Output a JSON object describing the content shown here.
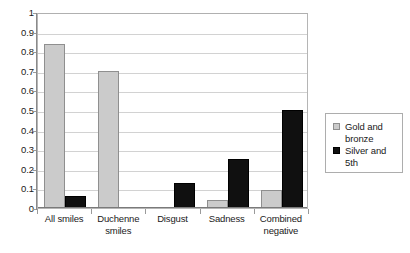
{
  "chart_data": {
    "type": "bar",
    "title": "",
    "subtitle": "",
    "xlabel": "",
    "ylabel": "",
    "ylim": [
      0,
      1
    ],
    "ytick_step": 0.1,
    "ytick_labels": [
      "1",
      "0.9",
      "0.8",
      "0.7",
      "0.6",
      "0.5",
      "0.4",
      "0.3",
      "0.2",
      "0.1",
      "0"
    ],
    "ytick_values": [
      1,
      0.9,
      0.8,
      0.7,
      0.6,
      0.5,
      0.4,
      0.3,
      0.2,
      0.1,
      0
    ],
    "grid": true,
    "grid_axis": "y",
    "legend_position": "right-outside",
    "categories": [
      "All smiles",
      "Duchenne smiles",
      "Disgust",
      "Sadness",
      "Combined negative"
    ],
    "category_label_lines": [
      [
        "All smiles"
      ],
      [
        "Duchenne",
        "smiles"
      ],
      [
        "Disgust"
      ],
      [
        "Sadness"
      ],
      [
        "Combined",
        "negative"
      ]
    ],
    "series": [
      {
        "name": "Gold and bronze",
        "legend_lines": [
          "Gold and",
          "bronze"
        ],
        "color": "#cbcbcb",
        "border_color": "#8f8f8f",
        "values": [
          0.835,
          0.7,
          0.0,
          0.04,
          0.09
        ]
      },
      {
        "name": "Silver and 5th",
        "legend_lines": [
          "Silver and",
          "5th"
        ],
        "color": "#101010",
        "border_color": "#000000",
        "values": [
          0.06,
          0.0,
          0.13,
          0.25,
          0.5
        ]
      }
    ]
  },
  "colors": {
    "gold_and_bronze": "#cbcbcb",
    "silver_and_5th": "#101010",
    "gridline": "#d2d2d2",
    "axis": "#8a8a8a",
    "plot_border": "#b5b5b5",
    "text": "#1a1a1a",
    "background": "#ffffff"
  }
}
